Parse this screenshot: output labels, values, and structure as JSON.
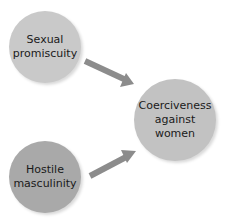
{
  "diagram": {
    "nodes": [
      {
        "id": "sexual-promiscuity",
        "label": "Sexual\npromiscuity",
        "cx": 45,
        "cy": 47,
        "r": 36,
        "color": "#c9c9c9"
      },
      {
        "id": "hostile-masculinity",
        "label": "Hostile\nmasculinity",
        "cx": 45,
        "cy": 177,
        "r": 36,
        "color": "#a9a9a9"
      },
      {
        "id": "coerciveness-against-women",
        "label": "Coerciveness\nagainst\nwomen",
        "cx": 175,
        "cy": 120,
        "r": 41,
        "color": "#c2c2c2"
      }
    ],
    "edges": [
      {
        "from": "sexual-promiscuity",
        "to": "coerciveness-against-women"
      },
      {
        "from": "hostile-masculinity",
        "to": "coerciveness-against-women"
      }
    ],
    "arrow_color": "#8c8c8c"
  }
}
